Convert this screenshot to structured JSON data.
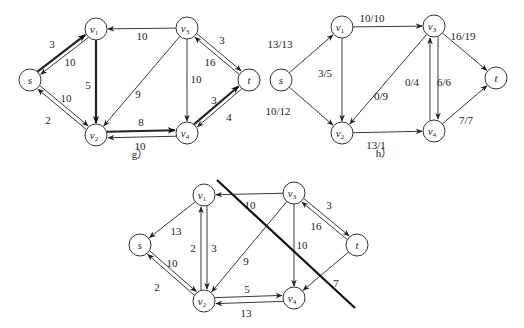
{
  "graphs": [
    {
      "id": "g",
      "caption": "g）",
      "caption_pos": [
        140,
        158
      ],
      "nodes": [
        {
          "id": "s",
          "label": "s",
          "sub": "",
          "x": 30,
          "y": 80
        },
        {
          "id": "v1",
          "label": "v",
          "sub": "1",
          "x": 96,
          "y": 29
        },
        {
          "id": "v2",
          "label": "v",
          "sub": "2",
          "x": 96,
          "y": 135
        },
        {
          "id": "v3",
          "label": "v",
          "sub": "3",
          "x": 187,
          "y": 28
        },
        {
          "id": "v4",
          "label": "v",
          "sub": "4",
          "x": 187,
          "y": 133
        },
        {
          "id": "t",
          "label": "t",
          "sub": "",
          "x": 249,
          "y": 80
        }
      ],
      "edges": [
        {
          "from": "s",
          "to": "v1",
          "label": "3",
          "bold": true,
          "offset": -2,
          "lx": 52,
          "ly": 48
        },
        {
          "from": "v1",
          "to": "s",
          "label": "10",
          "bold": false,
          "offset": -2,
          "lx": 70,
          "ly": 66
        },
        {
          "from": "v1",
          "to": "v2",
          "label": "5",
          "bold": true,
          "offset": 0,
          "lx": 88,
          "ly": 89
        },
        {
          "from": "v3",
          "to": "v1",
          "label": "10",
          "bold": false,
          "offset": 0,
          "lx": 142,
          "ly": 40
        },
        {
          "from": "v3",
          "to": "v2",
          "label": "9",
          "bold": false,
          "offset": 0,
          "lx": 138,
          "ly": 98
        },
        {
          "from": "v3",
          "to": "v4",
          "label": "10",
          "bold": false,
          "offset": 0,
          "lx": 196,
          "ly": 83
        },
        {
          "from": "v3",
          "to": "t",
          "label": "3",
          "bold": false,
          "offset": -2,
          "lx": 222,
          "ly": 44
        },
        {
          "from": "t",
          "to": "v3",
          "label": "16",
          "bold": false,
          "offset": -2,
          "lx": 210,
          "ly": 66
        },
        {
          "from": "v2",
          "to": "s",
          "label": "10",
          "bold": false,
          "offset": -2,
          "lx": 66,
          "ly": 102
        },
        {
          "from": "s",
          "to": "v2",
          "label": "2",
          "bold": false,
          "offset": -2,
          "lx": 48,
          "ly": 124
        },
        {
          "from": "v2",
          "to": "v4",
          "label": "8",
          "bold": true,
          "offset": -3,
          "lx": 141,
          "ly": 126
        },
        {
          "from": "v4",
          "to": "v2",
          "label": "10",
          "bold": false,
          "offset": -3,
          "lx": 140,
          "ly": 150
        },
        {
          "from": "v4",
          "to": "t",
          "label": "3",
          "bold": true,
          "offset": -2,
          "lx": 214,
          "ly": 104
        },
        {
          "from": "t",
          "to": "v4",
          "label": "4",
          "bold": false,
          "offset": -2,
          "lx": 229,
          "ly": 121
        }
      ]
    },
    {
      "id": "h",
      "caption": "h）",
      "caption_pos": [
        384,
        157
      ],
      "nodes": [
        {
          "id": "s",
          "label": "s",
          "sub": "",
          "x": 281,
          "y": 80
        },
        {
          "id": "v1",
          "label": "v",
          "sub": "1",
          "x": 342,
          "y": 27
        },
        {
          "id": "v2",
          "label": "v",
          "sub": "2",
          "x": 342,
          "y": 133
        },
        {
          "id": "v3",
          "label": "v",
          "sub": "3",
          "x": 434,
          "y": 26
        },
        {
          "id": "v4",
          "label": "v",
          "sub": "4",
          "x": 434,
          "y": 131
        },
        {
          "id": "t",
          "label": "t",
          "sub": "",
          "x": 496,
          "y": 78
        }
      ],
      "edges": [
        {
          "from": "s",
          "to": "v1",
          "label": "13/13",
          "bold": false,
          "offset": 0,
          "lx": 280,
          "ly": 48
        },
        {
          "from": "s",
          "to": "v2",
          "label": "10/12",
          "bold": false,
          "offset": 0,
          "lx": 278,
          "ly": 115
        },
        {
          "from": "v1",
          "to": "v3",
          "label": "10/10",
          "bold": false,
          "offset": 0,
          "lx": 372,
          "ly": 22
        },
        {
          "from": "v1",
          "to": "v2",
          "label": "3/5",
          "bold": false,
          "offset": 0,
          "lx": 325,
          "ly": 77
        },
        {
          "from": "v3",
          "to": "v2",
          "label": "0/9",
          "bold": false,
          "offset": 0,
          "lx": 381,
          "ly": 100
        },
        {
          "from": "v2",
          "to": "v4",
          "label": "13/1",
          "bold": false,
          "offset": 0,
          "lx": 376,
          "ly": 149
        },
        {
          "from": "v3",
          "to": "v4",
          "label": "0/4",
          "bold": false,
          "offset": -4,
          "lx": 412,
          "ly": 86
        },
        {
          "from": "v4",
          "to": "v3",
          "label": "6/6",
          "bold": false,
          "offset": -4,
          "lx": 444,
          "ly": 86
        },
        {
          "from": "v3",
          "to": "t",
          "label": "16/19",
          "bold": false,
          "offset": 0,
          "lx": 463,
          "ly": 40
        },
        {
          "from": "v4",
          "to": "t",
          "label": "7/7",
          "bold": false,
          "offset": 0,
          "lx": 466,
          "ly": 124
        }
      ]
    },
    {
      "id": "cut",
      "caption": "",
      "caption_pos": [
        0,
        0
      ],
      "nodes": [
        {
          "id": "s",
          "label": "s",
          "sub": "",
          "x": 140,
          "y": 245
        },
        {
          "id": "v1",
          "label": "v",
          "sub": "1",
          "x": 204,
          "y": 195
        },
        {
          "id": "v2",
          "label": "v",
          "sub": "2",
          "x": 204,
          "y": 301
        },
        {
          "id": "v3",
          "label": "v",
          "sub": "3",
          "x": 294,
          "y": 193
        },
        {
          "id": "v4",
          "label": "v",
          "sub": "4",
          "x": 294,
          "y": 298
        },
        {
          "id": "t",
          "label": "t",
          "sub": "",
          "x": 357,
          "y": 245
        }
      ],
      "edges": [
        {
          "from": "v1",
          "to": "s",
          "label": "13",
          "bold": false,
          "offset": 0,
          "lx": 176,
          "ly": 235
        },
        {
          "from": "v1",
          "to": "v2",
          "label": "2",
          "bold": false,
          "offset": -3,
          "lx": 193,
          "ly": 252
        },
        {
          "from": "v2",
          "to": "v1",
          "label": "3",
          "bold": false,
          "offset": -3,
          "lx": 214,
          "ly": 252
        },
        {
          "from": "v3",
          "to": "v1",
          "label": "10",
          "bold": false,
          "offset": 0,
          "lx": 250,
          "ly": 209
        },
        {
          "from": "v3",
          "to": "v2",
          "label": "9",
          "bold": false,
          "offset": 0,
          "lx": 246,
          "ly": 265
        },
        {
          "from": "v3",
          "to": "v4",
          "label": "10",
          "bold": false,
          "offset": 0,
          "lx": 302,
          "ly": 249
        },
        {
          "from": "v3",
          "to": "t",
          "label": "3",
          "bold": false,
          "offset": -2,
          "lx": 329,
          "ly": 209
        },
        {
          "from": "t",
          "to": "v3",
          "label": "16",
          "bold": false,
          "offset": -2,
          "lx": 316,
          "ly": 230
        },
        {
          "from": "t",
          "to": "v4",
          "label": "7",
          "bold": false,
          "offset": 0,
          "lx": 336,
          "ly": 287
        },
        {
          "from": "v2",
          "to": "s",
          "label": "10",
          "bold": false,
          "offset": -2,
          "lx": 172,
          "ly": 267
        },
        {
          "from": "s",
          "to": "v2",
          "label": "2",
          "bold": false,
          "offset": -2,
          "lx": 157,
          "ly": 291
        },
        {
          "from": "v2",
          "to": "v4",
          "label": "5",
          "bold": false,
          "offset": -3,
          "lx": 247,
          "ly": 293
        },
        {
          "from": "v4",
          "to": "v2",
          "label": "13",
          "bold": false,
          "offset": -3,
          "lx": 246,
          "ly": 317
        }
      ],
      "cut_line": {
        "x1": 217,
        "y1": 180,
        "x2": 355,
        "y2": 308
      }
    }
  ]
}
